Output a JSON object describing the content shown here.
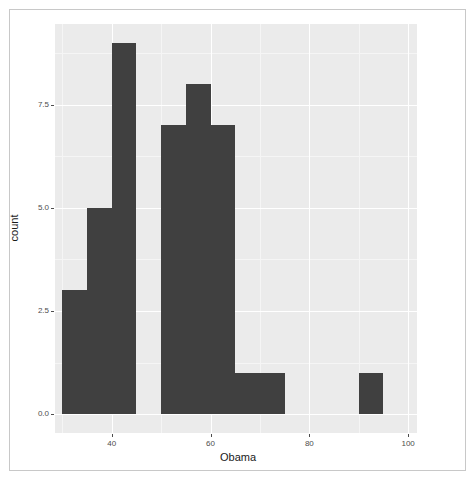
{
  "chart_data": {
    "type": "bar",
    "subtype": "histogram",
    "title": "",
    "xlabel": "Obama",
    "ylabel": "count",
    "xlim": [
      28.5,
      101.8
    ],
    "ylim": [
      -0.45,
      9.45
    ],
    "xticks": [
      40,
      60,
      80,
      100
    ],
    "xtick_labels": [
      "40",
      "60",
      "80",
      "100"
    ],
    "yticks": [
      0.0,
      2.5,
      5.0,
      7.5
    ],
    "ytick_labels": [
      "0.0",
      "2.5",
      "5.0",
      "7.5"
    ],
    "grid": true,
    "grid_major_color": "#ffffff",
    "grid_minor_color": "#f5f5f5",
    "panel_background": "#ebebeb",
    "bar_color": "#404040",
    "legend": null,
    "binwidth": 5,
    "bins": [
      {
        "x_start": 30,
        "x_end": 35,
        "count": 3
      },
      {
        "x_start": 35,
        "x_end": 40,
        "count": 5
      },
      {
        "x_start": 40,
        "x_end": 45,
        "count": 9
      },
      {
        "x_start": 45,
        "x_end": 50,
        "count": 0
      },
      {
        "x_start": 50,
        "x_end": 55,
        "count": 7
      },
      {
        "x_start": 55,
        "x_end": 60,
        "count": 8
      },
      {
        "x_start": 60,
        "x_end": 65,
        "count": 7
      },
      {
        "x_start": 65,
        "x_end": 70,
        "count": 1
      },
      {
        "x_start": 70,
        "x_end": 75,
        "count": 1
      },
      {
        "x_start": 75,
        "x_end": 80,
        "count": 0
      },
      {
        "x_start": 80,
        "x_end": 85,
        "count": 0
      },
      {
        "x_start": 85,
        "x_end": 90,
        "count": 0
      },
      {
        "x_start": 90,
        "x_end": 95,
        "count": 1
      }
    ],
    "categories": [
      "30-35",
      "35-40",
      "40-45",
      "45-50",
      "50-55",
      "55-60",
      "60-65",
      "65-70",
      "70-75",
      "75-80",
      "80-85",
      "85-90",
      "90-95"
    ],
    "values": [
      3,
      5,
      9,
      0,
      7,
      8,
      7,
      1,
      1,
      0,
      0,
      0,
      1
    ]
  }
}
